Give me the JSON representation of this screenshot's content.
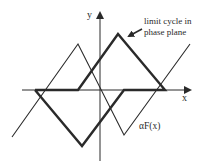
{
  "diagram": {
    "axes": {
      "x_label": "x",
      "y_label": "y"
    },
    "annotations": {
      "limit_cycle_line1": "limit cycle in",
      "limit_cycle_line2": "phase plane",
      "characteristic": "αF(x)"
    },
    "curves": {
      "characteristic_points": "12,137 78,44 124,135 190,44",
      "limit_cycle_points": "35,90 78,90 118,34 165,90 124,90 82,146 35,90"
    },
    "colors": {
      "stroke": "#2a2a2a",
      "background": "#ffffff"
    }
  }
}
